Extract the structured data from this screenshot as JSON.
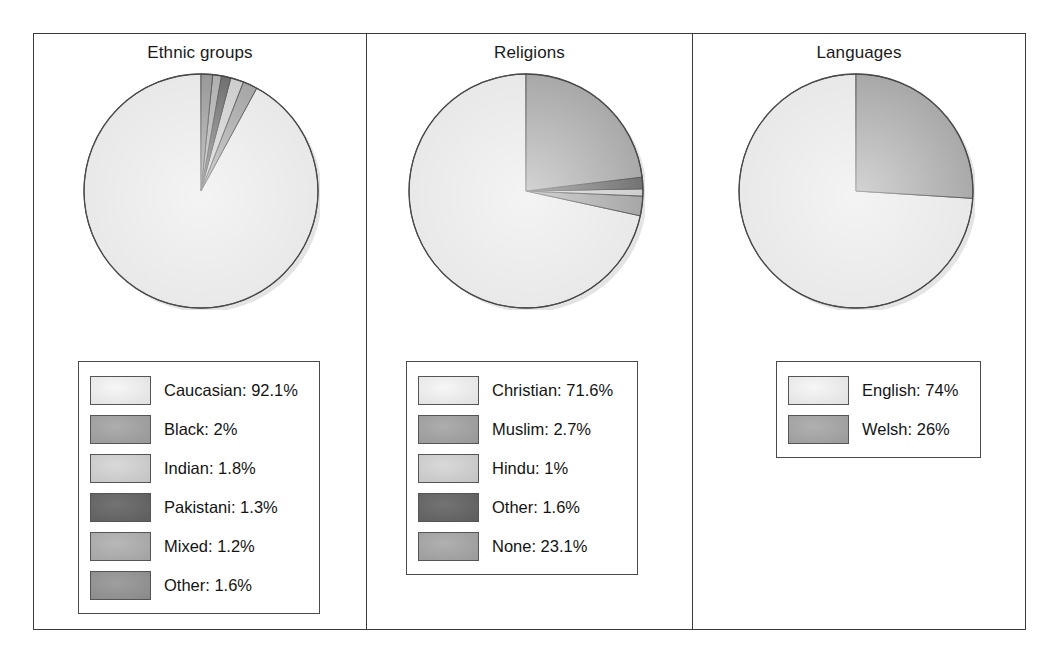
{
  "figure": {
    "panels": [
      {
        "id": "ethnic",
        "title": "Ethnic groups",
        "legend": [
          {
            "label": "Caucasian: 92.1%",
            "color": "#e6e6e6"
          },
          {
            "label": "Black: 2%",
            "color": "#9d9d9d"
          },
          {
            "label": "Indian: 1.8%",
            "color": "#c9c9c9"
          },
          {
            "label": "Pakistani: 1.3%",
            "color": "#636363"
          },
          {
            "label": "Mixed: 1.2%",
            "color": "#a8a8a8"
          },
          {
            "label": "Other: 1.6%",
            "color": "#8f8f8f"
          }
        ]
      },
      {
        "id": "religion",
        "title": "Religions",
        "legend": [
          {
            "label": "Christian: 71.6%",
            "color": "#e6e6e6"
          },
          {
            "label": "Muslim: 2.7%",
            "color": "#9d9d9d"
          },
          {
            "label": "Hindu: 1%",
            "color": "#c9c9c9"
          },
          {
            "label": "Other: 1.6%",
            "color": "#636363"
          },
          {
            "label": "None: 23.1%",
            "color": "#a0a0a0"
          }
        ]
      },
      {
        "id": "language",
        "title": "Languages",
        "legend": [
          {
            "label": "English: 74%",
            "color": "#e6e6e6"
          },
          {
            "label": "Welsh: 26%",
            "color": "#a0a0a0"
          }
        ]
      }
    ]
  },
  "chart_data": [
    {
      "type": "pie",
      "title": "Ethnic groups",
      "labels": [
        "Caucasian",
        "Black",
        "Indian",
        "Pakistani",
        "Mixed",
        "Other"
      ],
      "values": [
        92.1,
        2.0,
        1.8,
        1.3,
        1.2,
        1.6
      ],
      "unit": "%",
      "colors": [
        "#e6e6e6",
        "#9d9d9d",
        "#c9c9c9",
        "#636363",
        "#a8a8a8",
        "#8f8f8f"
      ],
      "legend_labels": [
        "Caucasian: 92.1%",
        "Black: 2%",
        "Indian: 1.8%",
        "Pakistani: 1.3%",
        "Mixed: 1.2%",
        "Other: 1.6%"
      ],
      "start_angle_deg": 90,
      "direction": "counterclockwise",
      "legend_position": "below",
      "grid": false
    },
    {
      "type": "pie",
      "title": "Religions",
      "labels": [
        "Christian",
        "Muslim",
        "Hindu",
        "Other",
        "None"
      ],
      "values": [
        71.6,
        2.7,
        1.0,
        1.6,
        23.1
      ],
      "unit": "%",
      "colors": [
        "#e6e6e6",
        "#9d9d9d",
        "#c9c9c9",
        "#636363",
        "#a0a0a0"
      ],
      "legend_labels": [
        "Christian: 71.6%",
        "Muslim: 2.7%",
        "Hindu: 1%",
        "Other: 1.6%",
        "None: 23.1%"
      ],
      "start_angle_deg": 90,
      "direction": "counterclockwise",
      "legend_position": "below",
      "grid": false
    },
    {
      "type": "pie",
      "title": "Languages",
      "labels": [
        "English",
        "Welsh"
      ],
      "values": [
        74,
        26
      ],
      "unit": "%",
      "colors": [
        "#e6e6e6",
        "#a0a0a0"
      ],
      "legend_labels": [
        "English: 74%",
        "Welsh: 26%"
      ],
      "start_angle_deg": 90,
      "direction": "counterclockwise",
      "legend_position": "below",
      "grid": false
    }
  ]
}
